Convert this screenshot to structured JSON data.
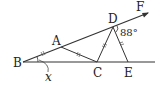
{
  "diagram": {
    "type": "geometry",
    "points": {
      "B": {
        "label": "B"
      },
      "A": {
        "label": "A"
      },
      "C": {
        "label": "C"
      },
      "D": {
        "label": "D"
      },
      "E": {
        "label": "E"
      },
      "F": {
        "label": "F"
      }
    },
    "angle_label": "88°",
    "unknown_angle": "x",
    "segments": [
      "BF (ray through A, D)",
      "BE (horizontal line)",
      "AC",
      "CD",
      "DE"
    ],
    "equal_marks": [
      "BA",
      "AC",
      "CD",
      "DE"
    ]
  }
}
